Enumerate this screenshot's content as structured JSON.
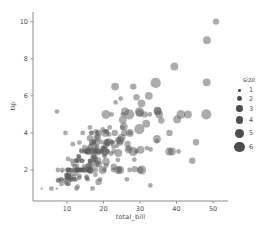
{
  "colors": {
    "background": "#ffffff",
    "point": "#5a5a5a",
    "point_opacity": 0.5,
    "legend_marker": "#2e2e2e",
    "axis": "#8c8c8c",
    "text": "#4d4d4d"
  },
  "chart_data": {
    "type": "scatter",
    "title": "",
    "xlabel": "total_bill",
    "ylabel": "tip",
    "xlim": [
      0.7,
      54.1
    ],
    "ylim": [
      0.33,
      10.52
    ],
    "xticks": [
      10,
      20,
      30,
      40,
      50
    ],
    "yticks": [
      2,
      4,
      6,
      8,
      10
    ],
    "grid": false,
    "legend": {
      "title": "size",
      "position": "right-outside",
      "entries": [
        "1",
        "2",
        "3",
        "4",
        "5",
        "6"
      ],
      "sizes": [
        1,
        2,
        3,
        4,
        5,
        6
      ]
    },
    "series_note": "points are [total_bill, tip, size]",
    "points": [
      [
        16.99,
        1.01,
        2
      ],
      [
        10.34,
        1.66,
        3
      ],
      [
        21.01,
        3.5,
        3
      ],
      [
        23.68,
        3.31,
        2
      ],
      [
        24.59,
        3.61,
        4
      ],
      [
        25.29,
        4.71,
        4
      ],
      [
        8.77,
        2.0,
        2
      ],
      [
        26.88,
        3.12,
        4
      ],
      [
        15.04,
        1.96,
        2
      ],
      [
        14.78,
        3.23,
        2
      ],
      [
        10.27,
        1.71,
        2
      ],
      [
        35.26,
        5.0,
        4
      ],
      [
        15.42,
        1.57,
        2
      ],
      [
        18.43,
        3.0,
        4
      ],
      [
        14.83,
        3.02,
        2
      ],
      [
        21.58,
        3.92,
        2
      ],
      [
        10.33,
        1.67,
        3
      ],
      [
        16.29,
        3.71,
        3
      ],
      [
        16.97,
        3.5,
        3
      ],
      [
        20.65,
        3.35,
        3
      ],
      [
        17.92,
        4.08,
        2
      ],
      [
        20.29,
        2.75,
        2
      ],
      [
        15.77,
        2.23,
        2
      ],
      [
        39.42,
        7.58,
        4
      ],
      [
        19.82,
        3.18,
        2
      ],
      [
        17.81,
        2.34,
        4
      ],
      [
        13.37,
        2.0,
        2
      ],
      [
        12.69,
        2.0,
        2
      ],
      [
        21.7,
        4.3,
        2
      ],
      [
        19.65,
        3.0,
        2
      ],
      [
        9.55,
        1.45,
        2
      ],
      [
        18.35,
        2.5,
        4
      ],
      [
        15.06,
        3.0,
        2
      ],
      [
        20.69,
        2.45,
        4
      ],
      [
        17.78,
        3.27,
        2
      ],
      [
        24.06,
        3.6,
        3
      ],
      [
        16.31,
        2.0,
        3
      ],
      [
        16.93,
        3.07,
        3
      ],
      [
        18.69,
        2.31,
        3
      ],
      [
        31.27,
        5.0,
        3
      ],
      [
        16.04,
        2.24,
        3
      ],
      [
        17.46,
        2.54,
        2
      ],
      [
        13.94,
        3.06,
        2
      ],
      [
        9.68,
        1.32,
        2
      ],
      [
        30.4,
        5.6,
        4
      ],
      [
        18.29,
        3.0,
        2
      ],
      [
        22.23,
        5.0,
        2
      ],
      [
        32.4,
        6.0,
        4
      ],
      [
        28.55,
        2.05,
        3
      ],
      [
        18.04,
        3.0,
        2
      ],
      [
        12.54,
        2.5,
        2
      ],
      [
        10.29,
        2.6,
        2
      ],
      [
        34.81,
        5.2,
        4
      ],
      [
        9.94,
        1.56,
        2
      ],
      [
        25.56,
        4.34,
        4
      ],
      [
        19.49,
        3.51,
        2
      ],
      [
        38.01,
        3.0,
        4
      ],
      [
        26.41,
        1.5,
        2
      ],
      [
        11.24,
        1.76,
        2
      ],
      [
        48.27,
        6.73,
        4
      ],
      [
        20.29,
        3.21,
        2
      ],
      [
        13.81,
        2.0,
        2
      ],
      [
        11.02,
        1.98,
        2
      ],
      [
        18.29,
        3.76,
        4
      ],
      [
        17.59,
        2.64,
        3
      ],
      [
        20.08,
        3.15,
        3
      ],
      [
        16.45,
        2.47,
        2
      ],
      [
        3.07,
        1.0,
        1
      ],
      [
        20.23,
        2.01,
        2
      ],
      [
        15.01,
        2.09,
        2
      ],
      [
        12.02,
        1.97,
        2
      ],
      [
        17.07,
        3.0,
        3
      ],
      [
        26.86,
        3.14,
        2
      ],
      [
        25.28,
        5.0,
        2
      ],
      [
        14.73,
        2.2,
        2
      ],
      [
        10.51,
        1.25,
        2
      ],
      [
        17.92,
        3.08,
        2
      ],
      [
        27.2,
        4.0,
        4
      ],
      [
        22.76,
        3.0,
        2
      ],
      [
        17.29,
        2.71,
        2
      ],
      [
        19.44,
        3.0,
        2
      ],
      [
        16.66,
        3.4,
        2
      ],
      [
        10.07,
        1.83,
        1
      ],
      [
        32.68,
        5.0,
        2
      ],
      [
        15.98,
        2.03,
        2
      ],
      [
        34.83,
        5.17,
        4
      ],
      [
        13.03,
        2.0,
        2
      ],
      [
        18.28,
        4.0,
        2
      ],
      [
        24.71,
        5.85,
        2
      ],
      [
        21.16,
        3.0,
        2
      ],
      [
        28.97,
        3.0,
        2
      ],
      [
        22.49,
        3.5,
        2
      ],
      [
        5.75,
        1.0,
        2
      ],
      [
        16.32,
        4.3,
        2
      ],
      [
        22.75,
        3.25,
        2
      ],
      [
        40.17,
        4.73,
        4
      ],
      [
        27.28,
        4.0,
        2
      ],
      [
        12.03,
        1.5,
        2
      ],
      [
        21.01,
        3.0,
        2
      ],
      [
        12.46,
        1.5,
        2
      ],
      [
        11.35,
        2.5,
        2
      ],
      [
        15.38,
        3.0,
        2
      ],
      [
        44.3,
        2.5,
        3
      ],
      [
        22.42,
        3.48,
        2
      ],
      [
        20.92,
        4.08,
        2
      ],
      [
        15.36,
        1.64,
        2
      ],
      [
        20.49,
        4.06,
        2
      ],
      [
        25.21,
        4.29,
        2
      ],
      [
        18.24,
        3.76,
        2
      ],
      [
        14.31,
        4.0,
        2
      ],
      [
        14.0,
        3.0,
        2
      ],
      [
        7.25,
        1.0,
        1
      ],
      [
        38.07,
        4.0,
        3
      ],
      [
        23.95,
        2.55,
        2
      ],
      [
        25.71,
        4.0,
        3
      ],
      [
        17.31,
        3.5,
        2
      ],
      [
        29.93,
        5.07,
        4
      ],
      [
        10.65,
        1.5,
        2
      ],
      [
        12.43,
        1.8,
        2
      ],
      [
        24.08,
        2.92,
        4
      ],
      [
        11.69,
        2.31,
        2
      ],
      [
        13.42,
        1.68,
        2
      ],
      [
        14.26,
        2.5,
        2
      ],
      [
        15.95,
        2.0,
        2
      ],
      [
        12.48,
        2.52,
        2
      ],
      [
        29.8,
        4.2,
        6
      ],
      [
        8.52,
        1.48,
        2
      ],
      [
        14.52,
        2.0,
        2
      ],
      [
        11.38,
        2.0,
        2
      ],
      [
        22.82,
        2.18,
        3
      ],
      [
        19.08,
        1.5,
        2
      ],
      [
        20.27,
        2.83,
        2
      ],
      [
        11.17,
        1.5,
        2
      ],
      [
        12.26,
        2.0,
        2
      ],
      [
        18.26,
        3.25,
        2
      ],
      [
        8.51,
        1.25,
        2
      ],
      [
        10.33,
        2.0,
        2
      ],
      [
        14.15,
        2.0,
        2
      ],
      [
        16.0,
        2.0,
        2
      ],
      [
        13.16,
        2.75,
        2
      ],
      [
        17.47,
        3.5,
        2
      ],
      [
        34.3,
        6.7,
        6
      ],
      [
        41.19,
        5.0,
        5
      ],
      [
        27.05,
        5.0,
        6
      ],
      [
        16.43,
        2.3,
        2
      ],
      [
        8.35,
        1.5,
        2
      ],
      [
        18.64,
        1.36,
        3
      ],
      [
        11.87,
        1.63,
        2
      ],
      [
        9.78,
        1.73,
        2
      ],
      [
        7.51,
        2.0,
        2
      ],
      [
        14.07,
        2.5,
        2
      ],
      [
        13.13,
        2.0,
        2
      ],
      [
        17.26,
        2.74,
        3
      ],
      [
        24.55,
        2.0,
        4
      ],
      [
        19.77,
        2.0,
        4
      ],
      [
        29.85,
        5.14,
        5
      ],
      [
        48.17,
        5.0,
        6
      ],
      [
        25.0,
        3.75,
        4
      ],
      [
        13.39,
        2.61,
        2
      ],
      [
        16.49,
        2.0,
        4
      ],
      [
        21.5,
        3.5,
        4
      ],
      [
        12.66,
        2.5,
        2
      ],
      [
        16.21,
        2.0,
        3
      ],
      [
        13.81,
        2.0,
        2
      ],
      [
        17.51,
        3.0,
        2
      ],
      [
        24.52,
        3.48,
        3
      ],
      [
        20.76,
        2.24,
        2
      ],
      [
        31.71,
        4.5,
        4
      ],
      [
        10.59,
        1.61,
        2
      ],
      [
        10.63,
        2.0,
        2
      ],
      [
        50.81,
        10.0,
        3
      ],
      [
        15.81,
        3.16,
        2
      ],
      [
        7.25,
        5.15,
        2
      ],
      [
        31.85,
        3.18,
        2
      ],
      [
        16.82,
        4.0,
        2
      ],
      [
        32.9,
        3.11,
        2
      ],
      [
        17.89,
        2.0,
        2
      ],
      [
        14.48,
        2.0,
        2
      ],
      [
        9.6,
        4.0,
        2
      ],
      [
        34.63,
        3.55,
        2
      ],
      [
        34.65,
        3.68,
        4
      ],
      [
        23.33,
        5.65,
        2
      ],
      [
        45.35,
        3.5,
        3
      ],
      [
        23.17,
        6.5,
        4
      ],
      [
        40.55,
        3.0,
        2
      ],
      [
        20.69,
        5.0,
        5
      ],
      [
        20.9,
        3.5,
        3
      ],
      [
        30.46,
        2.0,
        5
      ],
      [
        18.15,
        3.5,
        3
      ],
      [
        23.1,
        4.0,
        3
      ],
      [
        15.69,
        1.5,
        2
      ],
      [
        19.81,
        4.19,
        2
      ],
      [
        28.44,
        2.56,
        2
      ],
      [
        15.48,
        2.02,
        2
      ],
      [
        16.58,
        4.0,
        2
      ],
      [
        7.56,
        1.44,
        2
      ],
      [
        10.34,
        2.0,
        2
      ],
      [
        43.11,
        5.0,
        4
      ],
      [
        13.0,
        2.0,
        2
      ],
      [
        13.51,
        2.0,
        2
      ],
      [
        18.71,
        4.0,
        3
      ],
      [
        12.74,
        2.01,
        2
      ],
      [
        13.0,
        2.0,
        2
      ],
      [
        16.4,
        2.5,
        2
      ],
      [
        20.53,
        4.0,
        4
      ],
      [
        16.47,
        3.23,
        3
      ],
      [
        26.59,
        3.41,
        3
      ],
      [
        38.73,
        3.0,
        4
      ],
      [
        24.27,
        2.03,
        2
      ],
      [
        12.76,
        2.23,
        2
      ],
      [
        30.06,
        2.0,
        3
      ],
      [
        25.89,
        5.16,
        4
      ],
      [
        48.33,
        9.0,
        4
      ],
      [
        13.27,
        2.5,
        2
      ],
      [
        28.17,
        6.5,
        3
      ],
      [
        12.9,
        1.1,
        2
      ],
      [
        28.15,
        3.0,
        5
      ],
      [
        11.59,
        1.5,
        2
      ],
      [
        7.74,
        1.44,
        2
      ],
      [
        30.14,
        3.09,
        4
      ],
      [
        12.16,
        2.2,
        2
      ],
      [
        13.42,
        3.48,
        2
      ],
      [
        8.58,
        1.92,
        1
      ],
      [
        15.98,
        3.0,
        3
      ],
      [
        13.42,
        1.58,
        2
      ],
      [
        16.27,
        2.5,
        2
      ],
      [
        10.09,
        2.0,
        2
      ],
      [
        20.45,
        3.0,
        4
      ],
      [
        13.28,
        2.72,
        2
      ],
      [
        22.12,
        2.88,
        2
      ],
      [
        24.01,
        2.0,
        4
      ],
      [
        15.69,
        3.0,
        3
      ],
      [
        11.61,
        3.39,
        2
      ],
      [
        10.77,
        1.47,
        2
      ],
      [
        15.53,
        3.0,
        2
      ],
      [
        10.07,
        1.25,
        2
      ],
      [
        12.6,
        1.0,
        2
      ],
      [
        32.83,
        1.17,
        2
      ],
      [
        35.83,
        4.67,
        3
      ],
      [
        29.03,
        5.92,
        3
      ],
      [
        27.18,
        2.0,
        2
      ],
      [
        22.67,
        2.0,
        2
      ],
      [
        17.82,
        1.75,
        2
      ],
      [
        18.78,
        3.0,
        2
      ]
    ]
  }
}
